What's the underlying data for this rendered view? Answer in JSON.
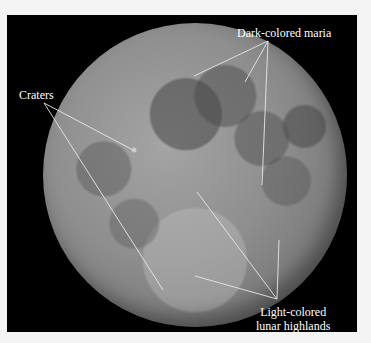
{
  "figure": {
    "background_color": "#000000",
    "labels": {
      "maria": "Dark-colored maria",
      "craters": "Craters",
      "highlands_line1": "Light-colored",
      "highlands_line2": "lunar highlands"
    },
    "pointer_color": "#e8e8e8"
  }
}
